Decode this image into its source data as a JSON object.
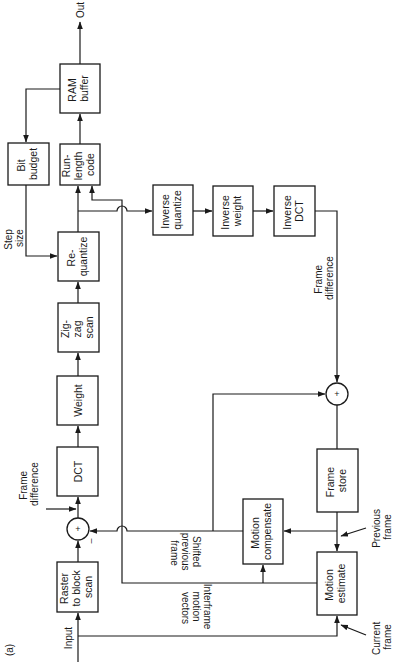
{
  "figure": {
    "label": "(a)",
    "orientation": "rotated 90deg counter-clockwise",
    "line_color": "#1a1a1a",
    "background": "#ffffff"
  },
  "blocks": {
    "raster": {
      "lines": [
        "Raster",
        "to block",
        "scan"
      ]
    },
    "dct": {
      "lines": [
        "DCT"
      ]
    },
    "weight": {
      "lines": [
        "Weight"
      ]
    },
    "zigzag": {
      "lines": [
        "Zig-",
        "zag",
        "scan"
      ]
    },
    "requantize": {
      "lines": [
        "Re-",
        "quantize"
      ]
    },
    "runlength": {
      "lines": [
        "Run-",
        "length",
        "code"
      ]
    },
    "ram": {
      "lines": [
        "RAM",
        "buffer"
      ]
    },
    "bitbudget": {
      "lines": [
        "Bit",
        "budget"
      ]
    },
    "invquant": {
      "lines": [
        "Inverse",
        "quantize"
      ]
    },
    "invweight": {
      "lines": [
        "Inverse",
        "weight"
      ]
    },
    "invdct": {
      "lines": [
        "Inverse",
        "DCT"
      ]
    },
    "framestore": {
      "lines": [
        "Frame",
        "store"
      ]
    },
    "motioncomp": {
      "lines": [
        "Motion",
        "compensate"
      ]
    },
    "motionest": {
      "lines": [
        "Motion",
        "estimate"
      ]
    }
  },
  "summers": {
    "input_sum": {
      "symbol": "+",
      "minus": "–"
    },
    "recon_sum": {
      "symbol": "+"
    }
  },
  "labels": {
    "input": "Input",
    "out": "Out",
    "step_size": [
      "Step",
      "size"
    ],
    "frame_difference_top": [
      "Frame",
      "difference"
    ],
    "frame_difference_mid": [
      "Frame",
      "difference"
    ],
    "shifted_previous_frame": [
      "Shifted",
      "previous",
      "frame"
    ],
    "interframe_motion_vectors": [
      "Interframe",
      "motion",
      "vectors"
    ],
    "previous_frame": [
      "Previous",
      "frame"
    ],
    "current_frame": [
      "Current",
      "frame"
    ]
  }
}
